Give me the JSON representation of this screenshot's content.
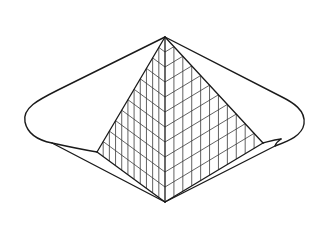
{
  "figure": {
    "title": "Glass pyramid line drawing",
    "description": "Isometric line drawing of a lattice-glazed pyramid set within a lens-shaped basin with rounded ends",
    "canvas": {
      "width": 323,
      "height": 229,
      "background": "#ffffff"
    },
    "colors": {
      "stroke": "#1a1a1a",
      "grid": "#3a3a3a"
    }
  },
  "geometry": {
    "apex": [
      165,
      37
    ],
    "bottom_vertex": [
      165,
      202
    ],
    "left_base_corner": [
      97,
      152
    ],
    "right_base_corner": [
      263,
      143
    ],
    "left_extreme": [
      25,
      120
    ],
    "right_extreme": [
      304,
      120
    ]
  },
  "lattice": {
    "left_face_vertical_lines": 10,
    "right_face_vertical_lines": 10,
    "diagonal_divisions": 11
  }
}
